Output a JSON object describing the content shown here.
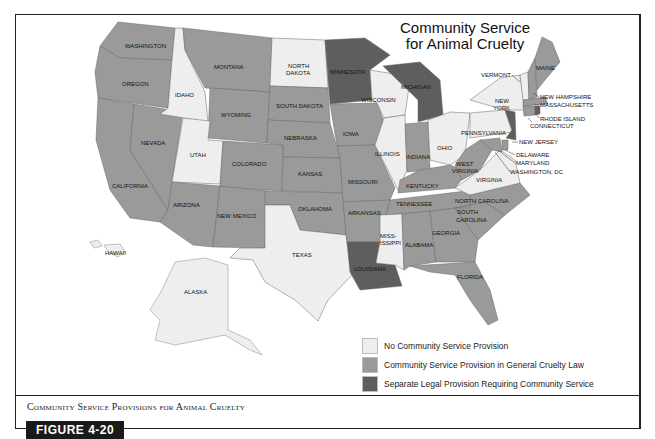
{
  "title": {
    "line1": "Community Service",
    "line2": "for Animal Cruelty"
  },
  "legend": [
    {
      "label": "No Community Service Provision",
      "color": "#eeeeee",
      "category": "none"
    },
    {
      "label": "Community Service Provision in General Cruelty Law",
      "color": "#9a9a9a",
      "category": "general"
    },
    {
      "label": "Separate Legal Provision Requiring Community Service",
      "color": "#5e5e5e",
      "category": "separate"
    }
  ],
  "caption": "Community Service Provisions for Animal Cruelty",
  "figure_label": "FIGURE 4-20",
  "states": {
    "none": [
      "North Dakota",
      "Idaho",
      "Utah",
      "Texas",
      "Wisconsin",
      "Illinois",
      "Ohio",
      "Mississippi",
      "New York",
      "Pennsylvania",
      "Virginia",
      "Alaska",
      "Hawaii",
      "Vermont"
    ],
    "general": [
      "Washington",
      "Oregon",
      "California",
      "Nevada",
      "Montana",
      "Wyoming",
      "Colorado",
      "Arizona",
      "New Mexico",
      "South Dakota",
      "Nebraska",
      "Kansas",
      "Oklahoma",
      "Iowa",
      "Missouri",
      "Arkansas",
      "Indiana",
      "Kentucky",
      "Tennessee",
      "Alabama",
      "Georgia",
      "Florida",
      "South Carolina",
      "North Carolina",
      "West Virginia",
      "Maine",
      "New Hampshire",
      "Massachusetts",
      "Connecticut",
      "Delaware",
      "Maryland",
      "Washington, DC"
    ],
    "separate": [
      "Minnesota",
      "Michigan",
      "Louisiana",
      "New Jersey",
      "Rhode Island"
    ]
  },
  "labels": {
    "washington": "WASHINGTON",
    "oregon": "OREGON",
    "california": "CALIFORNIA",
    "nevada": "NEVADA",
    "idaho": "IDAHO",
    "montana": "MONTANA",
    "wyoming": "WYOMING",
    "utah": "UTAH",
    "colorado": "COLORADO",
    "arizona": "ARIZONA",
    "new_mexico": "NEW MEXICO",
    "north_dakota_1": "NORTH",
    "north_dakota_2": "DAKOTA",
    "south_dakota": "SOUTH DAKOTA",
    "nebraska": "NEBRASKA",
    "kansas": "KANSAS",
    "oklahoma": "OKLAHOMA",
    "texas": "TEXAS",
    "minnesota": "MINNESOTA",
    "iowa": "IOWA",
    "missouri": "MISSOURI",
    "arkansas": "ARKANSAS",
    "louisiana": "LOUISIANA",
    "wisconsin": "WISCONSIN",
    "illinois": "ILLINOIS",
    "michigan": "MICHIGAN",
    "indiana": "INDIANA",
    "ohio": "OHIO",
    "kentucky": "KENTUCKY",
    "tennessee": "TENNESSEE",
    "mississippi_1": "MISS-",
    "mississippi_2": "ISSIPPI",
    "alabama": "ALABAMA",
    "georgia": "GEORGIA",
    "florida": "FLORIDA",
    "south_carolina_1": "SOUTH",
    "south_carolina_2": "CAROLINA",
    "north_carolina": "NORTH CAROLINA",
    "virginia": "VIRGINIA",
    "west_virginia_1": "WEST",
    "west_virginia_2": "VIRGINIA",
    "pennsylvania": "PENNSYLVANIA",
    "new_york_1": "NEW",
    "new_york_2": "YORK",
    "vermont": "VERMONT",
    "maine": "MAINE",
    "new_hampshire": "NEW HAMPSHIRE",
    "massachusetts": "MASSACHUSETTS",
    "rhode_island": "RHODE ISLAND",
    "connecticut": "CONNECTICUT",
    "new_jersey": "NEW JERSEY",
    "delaware": "DELAWARE",
    "maryland": "MARYLAND",
    "dc": "WASHINGTON, DC",
    "hawaii": "HAWAII",
    "alaska": "ALASKA"
  }
}
